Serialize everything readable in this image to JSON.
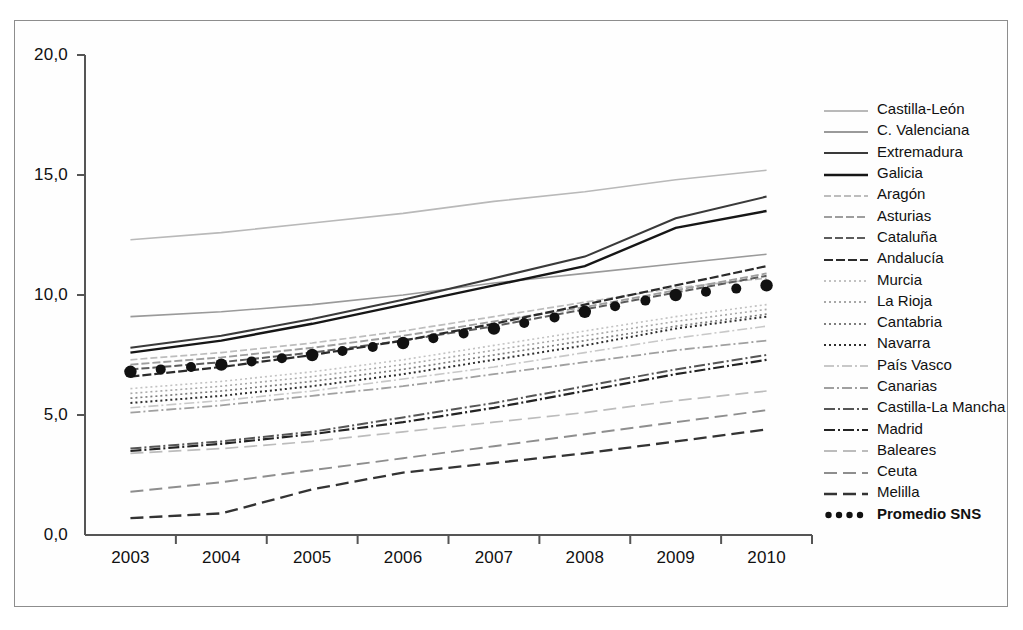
{
  "chart_data": {
    "type": "line",
    "title": "",
    "xlabel": "",
    "ylabel": "",
    "x": [
      2003,
      2004,
      2005,
      2006,
      2007,
      2008,
      2009,
      2010
    ],
    "xticklabels": [
      "2003",
      "2004",
      "2005",
      "2006",
      "2007",
      "2008",
      "2009",
      "2010"
    ],
    "yticklabels": [
      "0,0",
      "5,0",
      "10,0",
      "15,0",
      "20,0"
    ],
    "yticks": [
      0,
      5,
      10,
      15,
      20
    ],
    "ylim": [
      0,
      20
    ],
    "grid": false,
    "legend_position": "right",
    "series": [
      {
        "name": "Castilla-León",
        "values": [
          12.3,
          12.6,
          13.0,
          13.4,
          13.9,
          14.3,
          14.8,
          15.2
        ],
        "style": "solid",
        "color": "#b9b9b9",
        "width": 1.6,
        "dash": ""
      },
      {
        "name": "C. Valenciana",
        "values": [
          9.1,
          9.3,
          9.6,
          10.0,
          10.5,
          10.9,
          11.3,
          11.7
        ],
        "style": "solid",
        "color": "#9a9a9a",
        "width": 1.6,
        "dash": ""
      },
      {
        "name": "Extremadura",
        "values": [
          7.8,
          8.3,
          9.0,
          9.8,
          10.7,
          11.6,
          13.2,
          14.1
        ],
        "style": "solid",
        "color": "#3a3a3a",
        "width": 2.1,
        "dash": ""
      },
      {
        "name": "Galicia",
        "values": [
          7.6,
          8.1,
          8.8,
          9.6,
          10.4,
          11.2,
          12.8,
          13.5
        ],
        "style": "solid",
        "color": "#161616",
        "width": 2.4,
        "dash": ""
      },
      {
        "name": "Aragón",
        "values": [
          7.3,
          7.6,
          8.0,
          8.5,
          9.1,
          9.7,
          10.3,
          10.7
        ],
        "style": "dashed",
        "color": "#bdbdbd",
        "width": 1.7,
        "dash": "7,3"
      },
      {
        "name": "Asturias",
        "values": [
          7.1,
          7.4,
          7.8,
          8.3,
          8.9,
          9.5,
          10.2,
          10.9
        ],
        "style": "dashed",
        "color": "#9e9e9e",
        "width": 1.9,
        "dash": "8,3"
      },
      {
        "name": "Cataluña",
        "values": [
          6.9,
          7.2,
          7.6,
          8.1,
          8.7,
          9.4,
          10.1,
          10.8
        ],
        "style": "dashed",
        "color": "#5c5c5c",
        "width": 2.0,
        "dash": "8,3"
      },
      {
        "name": "Andalucía",
        "values": [
          6.6,
          7.0,
          7.5,
          8.1,
          8.8,
          9.6,
          10.4,
          11.2
        ],
        "style": "dashed",
        "color": "#2b2b2b",
        "width": 2.2,
        "dash": "9,3"
      },
      {
        "name": "Murcia",
        "values": [
          6.1,
          6.4,
          6.8,
          7.3,
          7.9,
          8.5,
          9.1,
          9.6
        ],
        "style": "dotted",
        "color": "#c2c2c2",
        "width": 1.6,
        "dash": "2,3"
      },
      {
        "name": "La Rioja",
        "values": [
          5.9,
          6.2,
          6.6,
          7.1,
          7.7,
          8.3,
          8.9,
          9.4
        ],
        "style": "dotted",
        "color": "#a8a8a8",
        "width": 1.6,
        "dash": "2,3"
      },
      {
        "name": "Cantabria",
        "values": [
          5.7,
          6.0,
          6.4,
          6.9,
          7.5,
          8.1,
          8.7,
          9.2
        ],
        "style": "dotted",
        "color": "#7d7d7d",
        "width": 1.7,
        "dash": "2,3"
      },
      {
        "name": "Navarra",
        "values": [
          5.5,
          5.8,
          6.2,
          6.7,
          7.3,
          7.9,
          8.6,
          9.1
        ],
        "style": "dotted",
        "color": "#2e2e2e",
        "width": 2.0,
        "dash": "2,3"
      },
      {
        "name": "País Vasco",
        "values": [
          5.3,
          5.6,
          6.0,
          6.5,
          7.0,
          7.6,
          8.2,
          8.7
        ],
        "style": "dashdot",
        "color": "#c8c8c8",
        "width": 1.6,
        "dash": "10,3,2,3"
      },
      {
        "name": "Canarias",
        "values": [
          5.1,
          5.4,
          5.8,
          6.2,
          6.7,
          7.2,
          7.7,
          8.1
        ],
        "style": "dashdot",
        "color": "#a0a0a0",
        "width": 1.8,
        "dash": "10,3,2,3"
      },
      {
        "name": "Castilla-La Mancha",
        "values": [
          3.6,
          3.9,
          4.3,
          4.9,
          5.5,
          6.2,
          6.9,
          7.5
        ],
        "style": "dashdot",
        "color": "#565656",
        "width": 2.0,
        "dash": "11,3,2,3"
      },
      {
        "name": "Madrid",
        "values": [
          3.5,
          3.8,
          4.2,
          4.7,
          5.3,
          6.0,
          6.7,
          7.3
        ],
        "style": "dashdot",
        "color": "#232323",
        "width": 2.2,
        "dash": "11,3,2,3"
      },
      {
        "name": "Baleares",
        "values": [
          3.4,
          3.6,
          3.9,
          4.3,
          4.7,
          5.1,
          5.6,
          6.0
        ],
        "style": "longdash",
        "color": "#bcbcbc",
        "width": 1.7,
        "dash": "13,6"
      },
      {
        "name": "Ceuta",
        "values": [
          1.8,
          2.2,
          2.7,
          3.2,
          3.7,
          4.2,
          4.7,
          5.2
        ],
        "style": "longdash",
        "color": "#8e8e8e",
        "width": 1.9,
        "dash": "13,6"
      },
      {
        "name": "Melilla",
        "values": [
          0.7,
          0.9,
          1.9,
          2.6,
          3.0,
          3.4,
          3.9,
          4.4
        ],
        "style": "longdash",
        "color": "#333333",
        "width": 2.3,
        "dash": "13,6"
      },
      {
        "name": "Promedio SNS",
        "values": [
          6.8,
          7.1,
          7.5,
          8.0,
          8.6,
          9.3,
          10.0,
          10.4
        ],
        "style": "marker-dots",
        "color": "#111111",
        "width": 0,
        "dash": "",
        "bold_label": true
      }
    ]
  },
  "axes": {
    "y_tick_labels": [
      "20,0",
      "15,0",
      "10,0",
      "5,0",
      "0,0"
    ],
    "x_tick_labels": [
      "2003",
      "2004",
      "2005",
      "2006",
      "2007",
      "2008",
      "2009",
      "2010"
    ]
  }
}
